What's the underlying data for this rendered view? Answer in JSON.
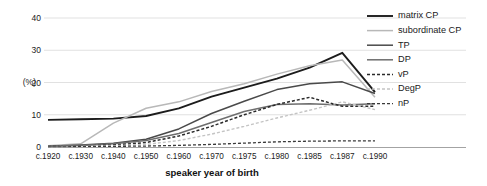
{
  "chart_data": {
    "type": "line",
    "title": "",
    "xlabel": "speaker year of birth",
    "ylabel": "(%)",
    "grid": true,
    "legend_position": "right",
    "ylim": [
      0,
      43
    ],
    "yticks": [
      0,
      10,
      20,
      30,
      40
    ],
    "categories": [
      "c.1920",
      "c.1930",
      "c.1940",
      "c.1950",
      "c.1960",
      "c.1970",
      "c.1975",
      "c.1980",
      "c.1985",
      "c.1987",
      "c.1990"
    ],
    "series": [
      {
        "name": "matrix CP",
        "color": "#1c1c1c",
        "width": 1.9,
        "dash": "none",
        "values": [
          8.4,
          8.6,
          8.8,
          9.6,
          12.0,
          15.6,
          18.4,
          21.2,
          24.6,
          29.2,
          17.0
        ]
      },
      {
        "name": "subordinate CP",
        "color": "#b8b8b8",
        "width": 1.5,
        "dash": "none",
        "values": [
          0.4,
          1.0,
          7.4,
          12.0,
          14.0,
          17.2,
          19.6,
          22.6,
          25.2,
          27.0,
          15.4
        ]
      },
      {
        "name": "TP",
        "color": "#4a4a4a",
        "width": 1.5,
        "dash": "none",
        "values": [
          0.2,
          0.6,
          1.2,
          2.4,
          5.6,
          10.4,
          14.2,
          17.8,
          19.6,
          20.2,
          16.6
        ]
      },
      {
        "name": "DP",
        "color": "#6e6e6e",
        "width": 1.5,
        "dash": "none",
        "values": [
          0.2,
          0.5,
          1.0,
          2.0,
          4.2,
          7.6,
          11.0,
          13.2,
          13.4,
          13.0,
          13.4
        ]
      },
      {
        "name": "vP",
        "color": "#2a2a2a",
        "width": 1.5,
        "dash": "3 2",
        "values": [
          0.1,
          0.3,
          0.6,
          1.4,
          3.4,
          6.4,
          10.0,
          13.2,
          15.4,
          12.6,
          12.6
        ]
      },
      {
        "name": "DegP",
        "color": "#c4c4c4",
        "width": 1.4,
        "dash": "3 2",
        "values": [
          0.1,
          0.2,
          0.4,
          0.8,
          2.0,
          4.0,
          6.4,
          9.0,
          11.4,
          14.0,
          11.6
        ]
      },
      {
        "name": "nP",
        "color": "#3a3a3a",
        "width": 1.3,
        "dash": "3 2",
        "values": [
          0.0,
          0.1,
          0.2,
          0.3,
          0.5,
          0.8,
          1.2,
          1.6,
          1.8,
          1.9,
          1.9
        ]
      }
    ]
  },
  "legend": {
    "items": [
      {
        "label": "matrix CP"
      },
      {
        "label": "subordinate CP"
      },
      {
        "label": "TP"
      },
      {
        "label": "DP"
      },
      {
        "label": "vP"
      },
      {
        "label": "DegP"
      },
      {
        "label": "nP"
      }
    ]
  },
  "axes": {
    "y_unit": "(%)",
    "y_tick_labels": [
      "40",
      "30",
      "20",
      "10",
      "0"
    ],
    "x_tick_labels": [
      "c.1920",
      "c.1930",
      "c.1940",
      "c.1950",
      "c.1960",
      "c.1970",
      "c.1975",
      "c.1980",
      "c.1985",
      "c.1987",
      "c.1990"
    ],
    "x_axis_title": "speaker year of birth"
  }
}
